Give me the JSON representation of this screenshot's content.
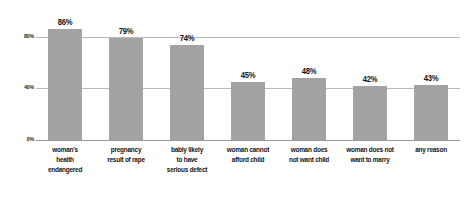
{
  "chart_data": {
    "type": "bar",
    "title": "",
    "subtitle": "",
    "xlabel": "",
    "ylabel": "",
    "ylim": [
      0,
      100
    ],
    "yticks": [
      "0%",
      "40%",
      "80%"
    ],
    "ytick_values": [
      0,
      40,
      80
    ],
    "grid": true,
    "legend": false,
    "legend_position": "none",
    "bar_color": "#a3a3a3",
    "gridline_color": "#b9b9b9",
    "value_label_format": "percent",
    "categories": [
      "woman's health endangered",
      "pregnancy result of rape",
      "bably likely to have serious defect",
      "woman cannot afford child",
      "woman does not want child",
      "woman does not want to marry",
      "any reason"
    ],
    "category_lines": [
      [
        "woman's",
        "health",
        "endangered"
      ],
      [
        "pregnancy",
        "result of rape"
      ],
      [
        "bably likely",
        "to have",
        "serious defect"
      ],
      [
        "woman cannot",
        "afford child"
      ],
      [
        "woman does",
        "not want child"
      ],
      [
        "woman does not",
        "want to marry"
      ],
      [
        "any reason"
      ]
    ],
    "values": [
      86,
      79,
      74,
      45,
      48,
      42,
      43
    ],
    "value_labels": [
      "86%",
      "79%",
      "74%",
      "45%",
      "48%",
      "42%",
      "43%"
    ]
  }
}
